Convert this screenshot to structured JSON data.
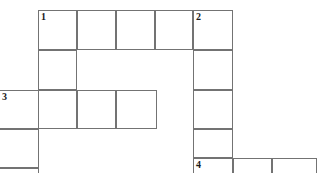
{
  "puzzle": {
    "kind": "crossword-grid",
    "title": "Crossword puzzle grid",
    "cell_size": 39,
    "colors": {
      "grid_line": "#737373",
      "cell_fill": "#ffffff",
      "number_text": "#1a1a1a",
      "page_background": "#ffffff"
    },
    "clue_numbers": [
      "1",
      "2",
      "3",
      "4"
    ],
    "cells": [
      {
        "id": "c1",
        "x": 38,
        "y": 10,
        "w": 39,
        "h": 40,
        "number": "1",
        "letter": ""
      },
      {
        "id": "c2",
        "x": 77,
        "y": 10,
        "w": 39,
        "h": 40,
        "number": "",
        "letter": ""
      },
      {
        "id": "c3",
        "x": 116,
        "y": 10,
        "w": 39,
        "h": 40,
        "number": "",
        "letter": ""
      },
      {
        "id": "c4",
        "x": 155,
        "y": 10,
        "w": 38,
        "h": 40,
        "number": "",
        "letter": ""
      },
      {
        "id": "c5",
        "x": 193,
        "y": 10,
        "w": 40,
        "h": 40,
        "number": "2",
        "letter": ""
      },
      {
        "id": "c6",
        "x": 38,
        "y": 50,
        "w": 39,
        "h": 40,
        "number": "",
        "letter": ""
      },
      {
        "id": "c7",
        "x": 193,
        "y": 50,
        "w": 40,
        "h": 40,
        "number": "",
        "letter": ""
      },
      {
        "id": "c8",
        "x": -1,
        "y": 90,
        "w": 40,
        "h": 39,
        "number": "3",
        "letter": ""
      },
      {
        "id": "c9",
        "x": 38,
        "y": 90,
        "w": 39,
        "h": 39,
        "number": "",
        "letter": ""
      },
      {
        "id": "c10",
        "x": 77,
        "y": 90,
        "w": 39,
        "h": 39,
        "number": "",
        "letter": ""
      },
      {
        "id": "c11",
        "x": 116,
        "y": 90,
        "w": 41,
        "h": 39,
        "number": "",
        "letter": ""
      },
      {
        "id": "c12",
        "x": 193,
        "y": 90,
        "w": 40,
        "h": 39,
        "number": "",
        "letter": ""
      },
      {
        "id": "c13",
        "x": -1,
        "y": 129,
        "w": 40,
        "h": 39,
        "number": "",
        "letter": ""
      },
      {
        "id": "c14",
        "x": 193,
        "y": 129,
        "w": 40,
        "h": 29,
        "number": "",
        "letter": ""
      },
      {
        "id": "c15",
        "x": -1,
        "y": 168,
        "w": 40,
        "h": 20,
        "number": "",
        "letter": ""
      },
      {
        "id": "c16",
        "x": 193,
        "y": 158,
        "w": 40,
        "h": 20,
        "number": "4",
        "letter": ""
      },
      {
        "id": "c17",
        "x": 233,
        "y": 158,
        "w": 39,
        "h": 20,
        "number": "",
        "letter": ""
      },
      {
        "id": "c18",
        "x": 272,
        "y": 158,
        "w": 45,
        "h": 20,
        "number": "",
        "letter": ""
      }
    ]
  }
}
